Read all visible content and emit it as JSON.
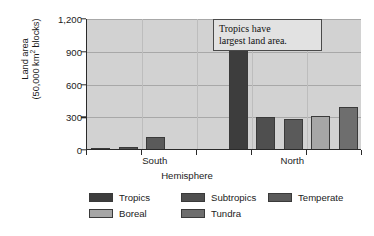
{
  "chart_data": {
    "type": "bar",
    "title": "",
    "xlabel": "Hemisphere",
    "ylabel": "Land area (50,000 km² blocks)",
    "ylabel_line1": "Land area",
    "ylabel_line2_pre": "(50,000 km",
    "ylabel_line2_sup": "2",
    "ylabel_line2_post": " blocks)",
    "categories": [
      "South",
      "North"
    ],
    "ylim": [
      0,
      1200
    ],
    "yticks": [
      0,
      300,
      600,
      900,
      1200
    ],
    "ytick_labels": [
      "0",
      "300",
      "600",
      "900",
      "1,200"
    ],
    "grid": true,
    "legend_position": "bottom",
    "series": [
      {
        "name": "Tropics",
        "color": "#3d3d3d",
        "values": [
          8,
          1080
        ]
      },
      {
        "name": "Subtropics",
        "color": "#4f4f4f",
        "values": [
          20,
          290
        ]
      },
      {
        "name": "Temperate",
        "color": "#5a5a5a",
        "values": [
          110,
          275
        ]
      },
      {
        "name": "Boreal",
        "color": "#a6a6a6",
        "values": [
          0,
          305
        ]
      },
      {
        "name": "Tundra",
        "color": "#6e6e6e",
        "values": [
          0,
          385
        ]
      }
    ],
    "annotations": [
      {
        "text_line1": "Tropics have",
        "text_line2": "largest land area."
      }
    ]
  },
  "legend": {
    "items": [
      {
        "label": "Tropics",
        "color": "#3d3d3d"
      },
      {
        "label": "Subtropics",
        "color": "#4f4f4f"
      },
      {
        "label": "Temperate",
        "color": "#5a5a5a"
      },
      {
        "label": "Boreal",
        "color": "#a6a6a6"
      },
      {
        "label": "Tundra",
        "color": "#6e6e6e"
      }
    ]
  }
}
